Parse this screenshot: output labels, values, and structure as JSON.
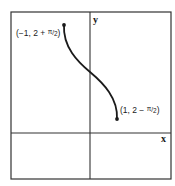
{
  "diagram": {
    "type": "function-graph",
    "frame": {
      "x1": 11,
      "y1": 12,
      "x2": 171,
      "y2": 179
    },
    "axes": {
      "origin_px": {
        "x": 90,
        "y": 133
      },
      "x_label": "x",
      "y_label": "y"
    },
    "curve": {
      "description": "y = 2 - arcsin(x), x in [-1, 1]",
      "start": {
        "x": -1,
        "y_expr": "2 + π/2"
      },
      "end": {
        "x": 1,
        "y_expr": "2 − π/2"
      }
    },
    "labels": {
      "start_point": {
        "prefix": "(−1, 2 + ",
        "pi": "π",
        "slash": "/",
        "den": "2",
        "suffix": ")"
      },
      "end_point": {
        "prefix": "(1, 2 − ",
        "pi": "π",
        "slash": "/",
        "den": "2",
        "suffix": ")"
      }
    },
    "colors": {
      "frame": "#333333",
      "axes": "#333333",
      "curve": "#1a1a1a",
      "background": "#ffffff"
    }
  }
}
